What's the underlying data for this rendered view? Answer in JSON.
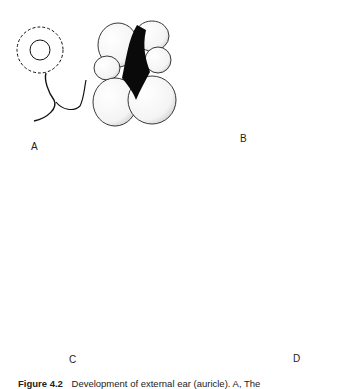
{
  "figure": {
    "panels": [
      {
        "id": "A",
        "label": "A"
      },
      {
        "id": "B",
        "label": "B"
      },
      {
        "id": "C",
        "label": "C"
      },
      {
        "id": "D",
        "label": "D"
      }
    ],
    "caption": {
      "number": "Figure 4.2",
      "text": "Development of external ear (auricle). A, The"
    }
  }
}
